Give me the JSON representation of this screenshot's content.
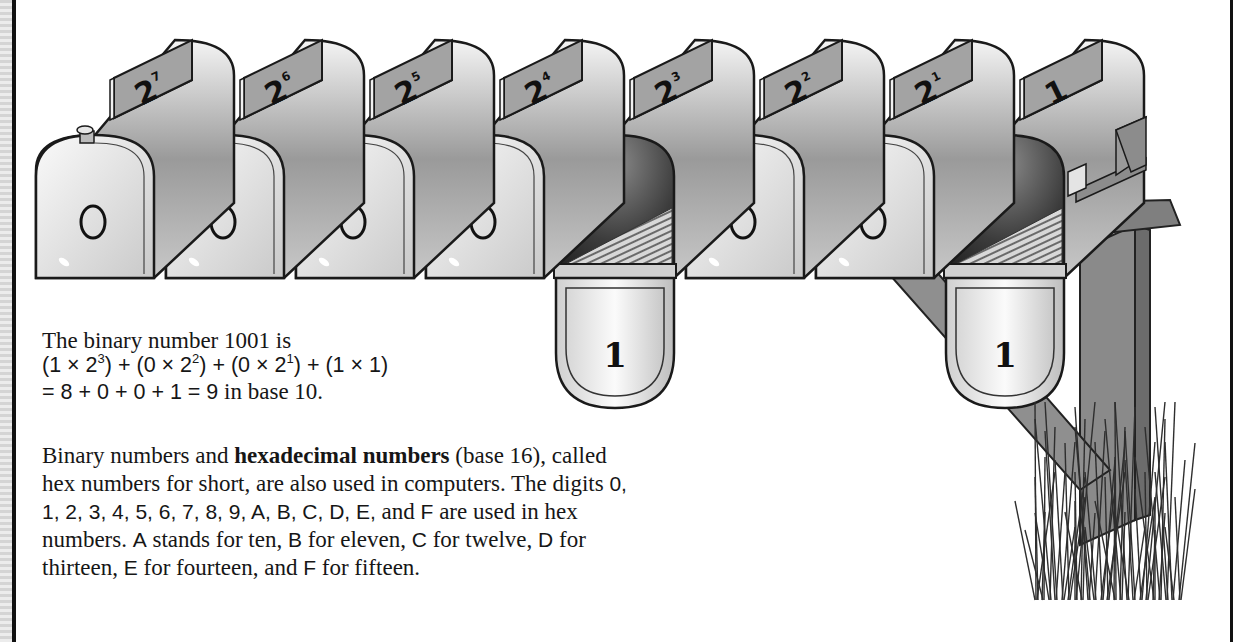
{
  "mailboxes": [
    {
      "label": "2",
      "exponent": "7",
      "digit": "0",
      "flag_down": true
    },
    {
      "label": "2",
      "exponent": "6",
      "digit": "0",
      "flag_down": true
    },
    {
      "label": "2",
      "exponent": "5",
      "digit": "0",
      "flag_down": true
    },
    {
      "label": "2",
      "exponent": "4",
      "digit": "0",
      "flag_down": true
    },
    {
      "label": "2",
      "exponent": "3",
      "digit": "1",
      "open": true
    },
    {
      "label": "2",
      "exponent": "2",
      "digit": "0",
      "flag_down": true
    },
    {
      "label": "2",
      "exponent": "1",
      "digit": "0",
      "flag_down": true
    },
    {
      "label": "1",
      "exponent": "",
      "digit": "1",
      "open": true,
      "has_side_flag": true
    }
  ],
  "example": {
    "line1": "The binary number 1001 is",
    "line2_parts": [
      "(1 × 2",
      "3",
      ") + (0 × 2",
      "2",
      ") + (0 × 2",
      "1",
      ") + (1 × 1)"
    ],
    "line3_a": "= 8 + 0 + 0 + 1 = 9",
    "line3_b": " in base 10."
  },
  "paragraph": {
    "l1_a": "Binary numbers and ",
    "l1_bold": "hexadecimal numbers",
    "l1_b": " (base 16), called",
    "l2_a": "hex numbers for short, are also used in computers. The digits ",
    "l2_b": "0,",
    "l3_a": "1, 2, 3, 4, 5, 6, 7, 8, 9, A, B, C, D, E,",
    "l3_b": " and ",
    "l3_c": "F",
    "l3_d": " are used in hex",
    "l4_a": "numbers. ",
    "l4_b": "A",
    "l4_c": " stands for ten, ",
    "l4_d": "B",
    "l4_e": " for eleven, ",
    "l4_f": "C",
    "l4_g": " for twelve, ",
    "l4_h": "D",
    "l4_i": " for",
    "l5_a": "thirteen, ",
    "l5_b": "E",
    "l5_c": " for fourteen, and ",
    "l5_d": "F",
    "l5_e": " for fifteen."
  }
}
